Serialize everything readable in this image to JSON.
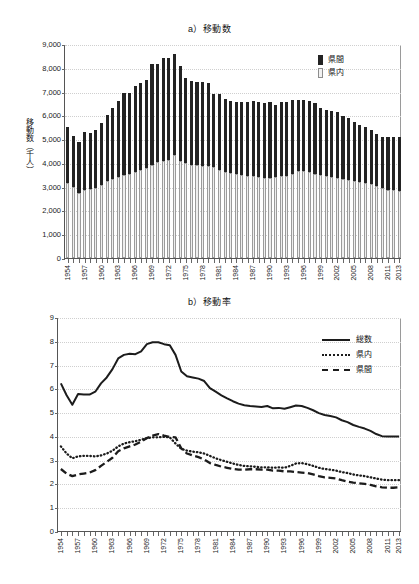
{
  "figure": {
    "charts": [
      {
        "id": "a",
        "title": "a）移動数",
        "ylabel": "移動数（千人）",
        "yticks": [
          "0",
          "1,000",
          "2,000",
          "3,000",
          "4,000",
          "5,000",
          "6,000",
          "7,000",
          "8,000",
          "9,000"
        ],
        "legend": [
          {
            "key": "inter",
            "label": "県間",
            "swatch": "dark"
          },
          {
            "key": "intra",
            "label": "県内",
            "swatch": "light"
          }
        ]
      },
      {
        "id": "b",
        "title": "b）移動率",
        "ylabel": "移動率（%）",
        "yticks": [
          "0",
          "1",
          "2",
          "3",
          "4",
          "5",
          "6",
          "7",
          "8",
          "9"
        ],
        "legend": [
          {
            "key": "total",
            "label": "総数",
            "swatch": "solid"
          },
          {
            "key": "intra",
            "label": "県内",
            "swatch": "dotted"
          },
          {
            "key": "inter",
            "label": "県間",
            "swatch": "dashed"
          }
        ]
      }
    ],
    "xlabels": [
      "1954",
      "1957",
      "1960",
      "1963",
      "1966",
      "1969",
      "1972",
      "1975",
      "1978",
      "1981",
      "1984",
      "1987",
      "1990",
      "1993",
      "1996",
      "1999",
      "2002",
      "2005",
      "2008",
      "2011",
      "2013"
    ]
  },
  "chart_data": [
    {
      "type": "bar",
      "title": "a）移動数",
      "xlabel": "",
      "ylabel": "移動数（千人）",
      "ylim": [
        0,
        9000
      ],
      "ytick_step": 1000,
      "grid": true,
      "legend_position": "top-right",
      "stacked": true,
      "x": [
        1954,
        1955,
        1956,
        1957,
        1958,
        1959,
        1960,
        1961,
        1962,
        1963,
        1964,
        1965,
        1966,
        1967,
        1968,
        1969,
        1970,
        1971,
        1972,
        1973,
        1974,
        1975,
        1976,
        1977,
        1978,
        1979,
        1980,
        1981,
        1982,
        1983,
        1984,
        1985,
        1986,
        1987,
        1988,
        1989,
        1990,
        1991,
        1992,
        1993,
        1994,
        1995,
        1996,
        1997,
        1998,
        1999,
        2000,
        2001,
        2002,
        2003,
        2004,
        2005,
        2006,
        2007,
        2008,
        2009,
        2010,
        2011,
        2012,
        2013
      ],
      "series": [
        {
          "name": "県内",
          "color": "#efefef",
          "values": [
            3150,
            2980,
            2740,
            2880,
            2900,
            2960,
            3060,
            3220,
            3320,
            3420,
            3480,
            3540,
            3620,
            3700,
            3800,
            3900,
            4020,
            4080,
            4120,
            4350,
            4100,
            3980,
            3920,
            3900,
            3880,
            3860,
            3820,
            3700,
            3620,
            3580,
            3520,
            3480,
            3460,
            3430,
            3400,
            3380,
            3380,
            3400,
            3430,
            3450,
            3520,
            3640,
            3680,
            3620,
            3540,
            3480,
            3460,
            3420,
            3380,
            3330,
            3280,
            3220,
            3180,
            3160,
            3100,
            3020,
            2950,
            2880,
            2840,
            2820
          ]
        },
        {
          "name": "県間",
          "color": "#232323",
          "values": [
            2350,
            2150,
            2160,
            2420,
            2370,
            2410,
            2620,
            2810,
            2990,
            3190,
            3480,
            3420,
            3620,
            3680,
            3700,
            4280,
            4150,
            4320,
            4280,
            4220,
            3970,
            3600,
            3520,
            3520,
            3530,
            3500,
            3070,
            3200,
            3070,
            3030,
            3040,
            3080,
            3100,
            3170,
            3150,
            3150,
            3170,
            3050,
            3120,
            3100,
            3120,
            3020,
            2970,
            2980,
            2960,
            2840,
            2760,
            2760,
            2760,
            2640,
            2590,
            2480,
            2420,
            2370,
            2300,
            2200,
            2150,
            2220,
            2240,
            2260
          ]
        }
      ],
      "totals": [
        5500,
        5130,
        4900,
        5300,
        5270,
        5370,
        5680,
        6030,
        6310,
        6610,
        6960,
        6960,
        7240,
        7380,
        7500,
        8180,
        8170,
        8400,
        8400,
        8570,
        8070,
        7580,
        7440,
        7420,
        7410,
        7360,
        6890,
        6900,
        6690,
        6610,
        6560,
        6560,
        6560,
        6600,
        6550,
        6530,
        6550,
        6450,
        6550,
        6550,
        6640,
        6660,
        6650,
        6600,
        6500,
        6320,
        6220,
        6180,
        6140,
        5970,
        5870,
        5700,
        5600,
        5530,
        5400,
        5220,
        5100,
        5100,
        5080,
        5080
      ]
    },
    {
      "type": "line",
      "title": "b）移動率",
      "xlabel": "",
      "ylabel": "移動率（%）",
      "ylim": [
        0,
        9
      ],
      "ytick_step": 1,
      "grid": true,
      "legend_position": "top-right",
      "x": [
        1954,
        1955,
        1956,
        1957,
        1958,
        1959,
        1960,
        1961,
        1962,
        1963,
        1964,
        1965,
        1966,
        1967,
        1968,
        1969,
        1970,
        1971,
        1972,
        1973,
        1974,
        1975,
        1976,
        1977,
        1978,
        1979,
        1980,
        1981,
        1982,
        1983,
        1984,
        1985,
        1986,
        1987,
        1988,
        1989,
        1990,
        1991,
        1992,
        1993,
        1994,
        1995,
        1996,
        1997,
        1998,
        1999,
        2000,
        2001,
        2002,
        2003,
        2004,
        2005,
        2006,
        2007,
        2008,
        2009,
        2010,
        2011,
        2012,
        2013
      ],
      "series": [
        {
          "name": "総数",
          "style": "solid",
          "values": [
            6.25,
            5.75,
            5.35,
            5.8,
            5.78,
            5.78,
            5.9,
            6.25,
            6.5,
            6.85,
            7.3,
            7.45,
            7.5,
            7.48,
            7.6,
            7.9,
            7.98,
            7.98,
            7.9,
            7.85,
            7.45,
            6.75,
            6.55,
            6.5,
            6.45,
            6.35,
            6.05,
            5.9,
            5.75,
            5.62,
            5.5,
            5.4,
            5.33,
            5.3,
            5.28,
            5.26,
            5.3,
            5.2,
            5.22,
            5.18,
            5.25,
            5.32,
            5.3,
            5.22,
            5.12,
            5.0,
            4.92,
            4.88,
            4.82,
            4.7,
            4.62,
            4.5,
            4.42,
            4.35,
            4.25,
            4.12,
            4.03,
            4.02,
            4.02,
            4.02
          ]
        },
        {
          "name": "県内",
          "style": "dotted",
          "values": [
            3.6,
            3.3,
            3.1,
            3.18,
            3.2,
            3.2,
            3.18,
            3.22,
            3.3,
            3.42,
            3.6,
            3.72,
            3.78,
            3.82,
            3.88,
            3.95,
            3.98,
            3.98,
            4.0,
            3.98,
            3.72,
            3.5,
            3.42,
            3.38,
            3.35,
            3.3,
            3.2,
            3.1,
            3.02,
            2.95,
            2.88,
            2.82,
            2.78,
            2.76,
            2.74,
            2.72,
            2.72,
            2.7,
            2.72,
            2.7,
            2.78,
            2.88,
            2.9,
            2.85,
            2.78,
            2.7,
            2.65,
            2.62,
            2.58,
            2.52,
            2.48,
            2.42,
            2.38,
            2.35,
            2.3,
            2.25,
            2.2,
            2.18,
            2.18,
            2.18
          ]
        },
        {
          "name": "県間",
          "style": "dashed",
          "values": [
            2.65,
            2.45,
            2.35,
            2.42,
            2.46,
            2.5,
            2.6,
            2.78,
            2.95,
            3.12,
            3.4,
            3.52,
            3.6,
            3.68,
            3.8,
            3.95,
            4.05,
            4.12,
            4.05,
            4.0,
            3.98,
            3.52,
            3.3,
            3.22,
            3.15,
            3.05,
            2.9,
            2.82,
            2.75,
            2.7,
            2.65,
            2.62,
            2.62,
            2.64,
            2.64,
            2.62,
            2.62,
            2.58,
            2.58,
            2.55,
            2.55,
            2.52,
            2.5,
            2.48,
            2.42,
            2.35,
            2.3,
            2.28,
            2.25,
            2.18,
            2.12,
            2.08,
            2.05,
            2.02,
            1.98,
            1.92,
            1.88,
            1.86,
            1.86,
            1.88
          ]
        }
      ]
    }
  ]
}
